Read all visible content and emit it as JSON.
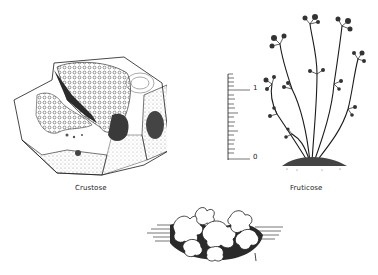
{
  "figure": {
    "specimens": [
      {
        "id": "crustose",
        "label": "Crustose"
      },
      {
        "id": "fruticose",
        "label": "Fruticose"
      },
      {
        "id": "foliose",
        "label": ""
      }
    ],
    "scale_bar": {
      "top_label": "1",
      "bottom_label": "0",
      "minor_ticks": 20
    },
    "colors": {
      "ink": "#1a1a1a",
      "background": "#ffffff",
      "shade": "#555555"
    }
  }
}
